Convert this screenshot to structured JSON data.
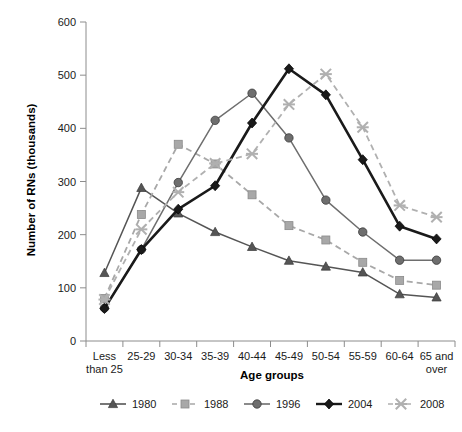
{
  "chart_data": {
    "type": "line",
    "title": "",
    "xlabel": "Age groups",
    "ylabel": "Number of RNs (thousands)",
    "categories": [
      "Less than 25",
      "25-29",
      "30-34",
      "35-39",
      "40-44",
      "45-49",
      "50-54",
      "55-59",
      "60-64",
      "65 and over"
    ],
    "ylim": [
      0,
      600
    ],
    "yticks": [
      0,
      100,
      200,
      300,
      400,
      500,
      600
    ],
    "ytick_labels": [
      "0",
      "100",
      "200",
      "300",
      "400",
      "500",
      "600"
    ],
    "grid": false,
    "legend_position": "bottom",
    "series": [
      {
        "name": "1980",
        "marker": "triangle",
        "dash": "solid",
        "color": "#555555",
        "values": [
          128,
          288,
          240,
          205,
          177,
          151,
          140,
          129,
          88,
          82
        ]
      },
      {
        "name": "1988",
        "marker": "square",
        "dash": "dashed",
        "color": "#a8a8a8",
        "values": [
          80,
          238,
          370,
          333,
          275,
          217,
          190,
          148,
          114,
          105
        ]
      },
      {
        "name": "1996",
        "marker": "circle",
        "dash": "solid",
        "color": "#6e6e6e",
        "values": [
          62,
          172,
          298,
          415,
          466,
          382,
          265,
          205,
          152,
          152
        ]
      },
      {
        "name": "2004",
        "marker": "diamond",
        "dash": "solid",
        "color": "#1a1a1a",
        "values": [
          61,
          172,
          248,
          292,
          410,
          512,
          463,
          341,
          216,
          192
        ]
      },
      {
        "name": "2008",
        "marker": "star",
        "dash": "dashed",
        "color": "#b0b0b0",
        "values": [
          78,
          210,
          280,
          334,
          352,
          445,
          502,
          402,
          255,
          233
        ]
      }
    ]
  },
  "axes": {
    "y_axis_title": "Number of RNs (thousands)",
    "x_axis_title": "Age groups",
    "y_tick_labels": [
      "600",
      "500",
      "400",
      "300",
      "200",
      "100",
      "0"
    ],
    "x_tick_labels": [
      {
        "line1": "Less",
        "line2": "than 25"
      },
      {
        "line1": "25-29",
        "line2": ""
      },
      {
        "line1": "30-34",
        "line2": ""
      },
      {
        "line1": "35-39",
        "line2": ""
      },
      {
        "line1": "40-44",
        "line2": ""
      },
      {
        "line1": "45-49",
        "line2": ""
      },
      {
        "line1": "50-54",
        "line2": ""
      },
      {
        "line1": "55-59",
        "line2": ""
      },
      {
        "line1": "60-64",
        "line2": ""
      },
      {
        "line1": "65 and",
        "line2": "over"
      }
    ]
  },
  "legend": {
    "items": [
      {
        "label": "1980"
      },
      {
        "label": "1988"
      },
      {
        "label": "1996"
      },
      {
        "label": "2004"
      },
      {
        "label": "2008"
      }
    ]
  },
  "colors": {
    "series_1980": "#555555",
    "series_1988": "#a8a8a8",
    "series_1996": "#6e6e6e",
    "series_2004": "#1a1a1a",
    "series_2008": "#b0b0b0",
    "axis": "#8c8c8c",
    "text": "#1a1a1a",
    "background": "#ffffff"
  }
}
